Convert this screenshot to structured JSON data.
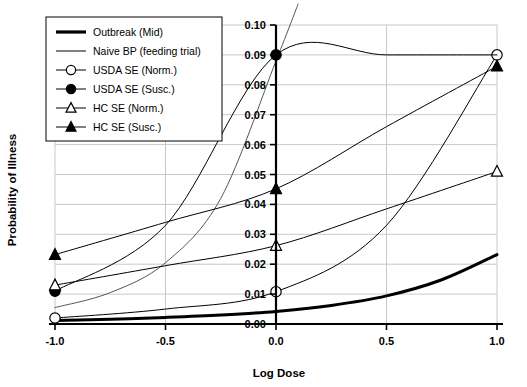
{
  "chart_data": {
    "type": "line",
    "title": "",
    "xlabel": "Log Dose",
    "ylabel": "Probability of Illness",
    "xlim": [
      -1.0,
      1.0
    ],
    "ylim": [
      0.0,
      0.1
    ],
    "grid": true,
    "legend_position": "top-left",
    "x_ticks": [
      "-1.0",
      "-0.5",
      "0.0",
      "0.5",
      "1.0"
    ],
    "x_tick_values": [
      -1.0,
      -0.5,
      0.0,
      0.5,
      1.0
    ],
    "y_ticks": [
      "0.00",
      "0.01",
      "0.02",
      "0.03",
      "0.04",
      "0.05",
      "0.06",
      "0.07",
      "0.08",
      "0.09",
      "0.10"
    ],
    "y_tick_values": [
      0.0,
      0.01,
      0.02,
      0.03,
      0.04,
      0.05,
      0.06,
      0.07,
      0.08,
      0.09,
      0.1
    ],
    "y_axis_x_position": 0.0,
    "series": [
      {
        "name": "Outbreak (Mid)",
        "marker": "none",
        "line_style": "thick-solid",
        "color": "#000000",
        "line_width": 3,
        "x": [
          -1.0,
          -0.75,
          -0.5,
          -0.25,
          0.0,
          0.25,
          0.5,
          0.75,
          1.0
        ],
        "values": [
          0.0012,
          0.0016,
          0.0022,
          0.003,
          0.0042,
          0.0062,
          0.0094,
          0.0148,
          0.0232
        ]
      },
      {
        "name": "Naive BP (feeding trial)",
        "marker": "none",
        "line_style": "thin-solid",
        "color": "#555555",
        "line_width": 1,
        "x": [
          -1.0,
          -0.75,
          -0.5,
          -0.25,
          0.0,
          0.1
        ],
        "values": [
          0.0055,
          0.0105,
          0.0205,
          0.042,
          0.088,
          0.107
        ]
      },
      {
        "name": "USDA SE (Norm.)",
        "marker": "open-circle",
        "line_style": "thin-solid",
        "color": "#000000",
        "line_width": 1,
        "x": [
          -1.0,
          -0.5,
          0.0,
          0.5,
          1.0
        ],
        "values": [
          0.002,
          0.005,
          0.0108,
          0.033,
          0.09
        ],
        "marker_points": [
          {
            "x": -1.0,
            "y": 0.002
          },
          {
            "x": 0.0,
            "y": 0.0108
          },
          {
            "x": 1.0,
            "y": 0.09
          }
        ]
      },
      {
        "name": "USDA SE (Susc.)",
        "marker": "filled-circle",
        "line_style": "thin-solid",
        "color": "#000000",
        "line_width": 1,
        "x": [
          -1.0,
          -0.5,
          0.0,
          0.5,
          1.0
        ],
        "values": [
          0.011,
          0.033,
          0.09,
          0.09,
          0.09
        ],
        "marker_points": [
          {
            "x": -1.0,
            "y": 0.011
          },
          {
            "x": 0.0,
            "y": 0.09
          }
        ]
      },
      {
        "name": "HC SE (Norm.)",
        "marker": "open-triangle",
        "line_style": "thin-solid",
        "color": "#000000",
        "line_width": 1,
        "x": [
          -1.0,
          -0.5,
          0.0,
          0.5,
          1.0
        ],
        "values": [
          0.013,
          0.0195,
          0.0262,
          0.0385,
          0.051
        ],
        "marker_points": [
          {
            "x": -1.0,
            "y": 0.013
          },
          {
            "x": 0.0,
            "y": 0.0262
          },
          {
            "x": 1.0,
            "y": 0.051
          }
        ]
      },
      {
        "name": "HC SE (Susc.)",
        "marker": "filled-triangle",
        "line_style": "thin-solid",
        "color": "#000000",
        "line_width": 1,
        "x": [
          -1.0,
          -0.5,
          0.0,
          0.5,
          1.0
        ],
        "values": [
          0.0232,
          0.034,
          0.0452,
          0.066,
          0.0862
        ],
        "marker_points": [
          {
            "x": -1.0,
            "y": 0.0232
          },
          {
            "x": 0.0,
            "y": 0.0452
          },
          {
            "x": 1.0,
            "y": 0.0862
          }
        ]
      }
    ]
  },
  "legend": {
    "items": [
      {
        "label": "Outbreak (Mid)",
        "marker": "none",
        "line": "thick"
      },
      {
        "label": "Naive BP (feeding trial)",
        "marker": "none",
        "line": "thin"
      },
      {
        "label": "USDA SE (Norm.)",
        "marker": "open-circle",
        "line": "thin"
      },
      {
        "label": "USDA SE (Susc.)",
        "marker": "filled-circle",
        "line": "thin"
      },
      {
        "label": "HC SE (Norm.)",
        "marker": "open-triangle",
        "line": "thin"
      },
      {
        "label": "HC SE (Susc.)",
        "marker": "filled-triangle",
        "line": "thin"
      }
    ]
  },
  "colors": {
    "axis": "#000000",
    "grid": "#c8c8c8",
    "series_primary": "#000000",
    "series_secondary": "#555555",
    "background": "#ffffff"
  }
}
